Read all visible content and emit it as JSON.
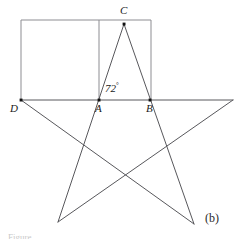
{
  "figure": {
    "panel_label": "(b)",
    "angle_label": {
      "value": "72",
      "degree_symbol": "°"
    },
    "caption_fragment": "Figure",
    "colors": {
      "stroke": "#58585c",
      "rect_stroke": "#8d8d92",
      "point_fill": "#111111",
      "text": "#1a1a1a",
      "background": "#ffffff"
    },
    "points": [
      {
        "id": "A",
        "label": "A",
        "x": 99,
        "y": 100,
        "label_x": 95,
        "label_y": 104,
        "marker": true
      },
      {
        "id": "B",
        "label": "B",
        "x": 150,
        "y": 100,
        "label_x": 146,
        "label_y": 104,
        "marker": true
      },
      {
        "id": "C",
        "label": "C",
        "x": 124,
        "y": 24,
        "label_x": 120,
        "label_y": 6,
        "marker": true
      },
      {
        "id": "D",
        "label": "D",
        "x": 21,
        "y": 100,
        "label_x": 10,
        "label_y": 104,
        "marker": true
      }
    ],
    "star_vertices": {
      "left": {
        "x": 21,
        "y": 100
      },
      "right": {
        "x": 233,
        "y": 100
      },
      "apex": {
        "x": 124,
        "y": 24
      },
      "bottom_left": {
        "x": 58,
        "y": 222
      },
      "bottom_right": {
        "x": 194,
        "y": 224
      }
    },
    "rectangle": {
      "left": 21,
      "top": 20,
      "right": 151,
      "bottom": 100,
      "inner_vertical_x": 99
    }
  }
}
